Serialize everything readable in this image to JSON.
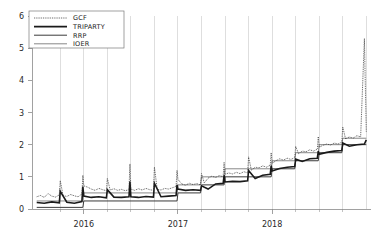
{
  "chart_data": {
    "type": "line",
    "title": "",
    "subtitle": "",
    "xlabel": "",
    "ylabel": "",
    "xlim": [
      2015.45,
      2019.05
    ],
    "ylim": [
      0,
      6
    ],
    "yticks": [
      0,
      1,
      2,
      3,
      4,
      5,
      6
    ],
    "ytick_labels": [
      "0",
      "1",
      "2",
      "3",
      "4",
      "5",
      "6"
    ],
    "xticks": [
      2016,
      2017,
      2018
    ],
    "xtick_labels": [
      "2016",
      "2017",
      "2018"
    ],
    "x_minor_ticks": [
      2015.75,
      2016.25,
      2016.5,
      2016.75,
      2017.25,
      2017.5,
      2017.75,
      2018.25,
      2018.5,
      2018.75
    ],
    "grid": "vertical-quarterly",
    "grid_x": [
      2015.75,
      2016.0,
      2016.25,
      2016.5,
      2016.75,
      2017.0,
      2017.25,
      2017.5,
      2017.75,
      2018.0,
      2018.25,
      2018.5,
      2018.75,
      2019.0
    ],
    "legend_position": "top-left",
    "legend": [
      "GCF",
      "TRIPARTY",
      "RRP",
      "IOER"
    ],
    "series": [
      {
        "name": "GCF",
        "style": "dotted",
        "color": "#303030",
        "width": 0.8,
        "x": [
          2015.5,
          2015.54,
          2015.58,
          2015.62,
          2015.66,
          2015.7,
          2015.74,
          2015.75,
          2015.78,
          2015.82,
          2015.86,
          2015.9,
          2015.94,
          2015.98,
          2015.99,
          2016.0,
          2016.04,
          2016.08,
          2016.12,
          2016.16,
          2016.2,
          2016.24,
          2016.25,
          2016.28,
          2016.32,
          2016.36,
          2016.4,
          2016.44,
          2016.48,
          2016.49,
          2016.5,
          2016.54,
          2016.58,
          2016.62,
          2016.66,
          2016.7,
          2016.74,
          2016.75,
          2016.78,
          2016.82,
          2016.86,
          2016.9,
          2016.94,
          2016.98,
          2016.99,
          2017.0,
          2017.04,
          2017.08,
          2017.12,
          2017.16,
          2017.2,
          2017.24,
          2017.25,
          2017.28,
          2017.32,
          2017.36,
          2017.4,
          2017.44,
          2017.48,
          2017.49,
          2017.5,
          2017.54,
          2017.58,
          2017.62,
          2017.66,
          2017.7,
          2017.74,
          2017.75,
          2017.78,
          2017.82,
          2017.86,
          2017.9,
          2017.94,
          2017.98,
          2017.99,
          2018.0,
          2018.04,
          2018.08,
          2018.12,
          2018.16,
          2018.2,
          2018.24,
          2018.25,
          2018.28,
          2018.32,
          2018.36,
          2018.4,
          2018.44,
          2018.48,
          2018.49,
          2018.5,
          2018.54,
          2018.58,
          2018.62,
          2018.66,
          2018.7,
          2018.74,
          2018.75,
          2018.78,
          2018.82,
          2018.86,
          2018.9,
          2018.94,
          2018.98,
          2019.0
        ],
        "y": [
          0.38,
          0.42,
          0.36,
          0.48,
          0.4,
          0.37,
          0.44,
          0.88,
          0.42,
          0.39,
          0.45,
          0.41,
          0.38,
          0.47,
          1.05,
          0.72,
          0.68,
          0.62,
          0.58,
          0.64,
          0.6,
          0.57,
          0.95,
          0.59,
          0.63,
          0.58,
          0.61,
          0.57,
          0.6,
          1.4,
          0.62,
          0.58,
          0.63,
          0.59,
          0.64,
          0.6,
          0.58,
          1.3,
          0.61,
          0.59,
          0.64,
          0.62,
          0.66,
          0.7,
          1.2,
          0.92,
          0.78,
          0.74,
          0.8,
          0.76,
          0.79,
          0.75,
          1.1,
          0.81,
          0.96,
          1.02,
          0.98,
          1.04,
          1.0,
          1.45,
          1.08,
          1.12,
          1.09,
          1.14,
          1.1,
          1.16,
          1.12,
          1.62,
          1.2,
          1.3,
          1.28,
          1.34,
          1.3,
          1.36,
          1.75,
          1.42,
          1.5,
          1.56,
          1.52,
          1.58,
          1.54,
          1.6,
          1.95,
          1.72,
          1.8,
          1.78,
          1.84,
          1.8,
          1.86,
          2.25,
          1.92,
          1.98,
          2.02,
          1.99,
          2.05,
          2.02,
          2.08,
          2.55,
          2.18,
          2.24,
          2.2,
          2.28,
          2.24,
          5.3,
          2.4
        ]
      },
      {
        "name": "TRIPARTY",
        "style": "solid-thick",
        "color": "#1a1a1a",
        "width": 1.6,
        "x": [
          2015.5,
          2015.58,
          2015.66,
          2015.74,
          2015.75,
          2015.82,
          2015.9,
          2015.98,
          2015.99,
          2016.0,
          2016.08,
          2016.16,
          2016.24,
          2016.25,
          2016.32,
          2016.4,
          2016.48,
          2016.49,
          2016.5,
          2016.58,
          2016.66,
          2016.74,
          2016.75,
          2016.82,
          2016.9,
          2016.98,
          2016.99,
          2017.0,
          2017.08,
          2017.16,
          2017.24,
          2017.25,
          2017.32,
          2017.4,
          2017.48,
          2017.49,
          2017.5,
          2017.58,
          2017.66,
          2017.74,
          2017.75,
          2017.82,
          2017.9,
          2017.98,
          2017.99,
          2018.0,
          2018.08,
          2018.16,
          2018.24,
          2018.25,
          2018.32,
          2018.4,
          2018.48,
          2018.49,
          2018.5,
          2018.58,
          2018.66,
          2018.74,
          2018.75,
          2018.82,
          2018.9,
          2018.98,
          2019.0
        ],
        "y": [
          0.2,
          0.18,
          0.22,
          0.19,
          0.55,
          0.21,
          0.18,
          0.23,
          0.7,
          0.4,
          0.36,
          0.38,
          0.35,
          0.6,
          0.37,
          0.36,
          0.38,
          0.85,
          0.38,
          0.36,
          0.39,
          0.37,
          0.8,
          0.38,
          0.4,
          0.42,
          0.75,
          0.62,
          0.58,
          0.6,
          0.58,
          0.72,
          0.62,
          0.78,
          0.8,
          1.05,
          0.84,
          0.86,
          0.85,
          0.88,
          1.2,
          0.95,
          1.05,
          1.08,
          1.35,
          1.18,
          1.26,
          1.3,
          1.32,
          1.55,
          1.48,
          1.56,
          1.58,
          1.8,
          1.7,
          1.76,
          1.8,
          1.82,
          2.05,
          1.95,
          2.0,
          2.02,
          2.15
        ]
      },
      {
        "name": "RRP",
        "style": "solid-medium",
        "color": "#3a3a3a",
        "width": 1.0,
        "x": [
          2015.5,
          2015.99,
          2016.0,
          2016.99,
          2017.0,
          2017.24,
          2017.25,
          2017.49,
          2017.5,
          2017.99,
          2018.0,
          2018.24,
          2018.25,
          2018.49,
          2018.5,
          2018.74,
          2018.75,
          2019.0
        ],
        "y": [
          0.05,
          0.05,
          0.25,
          0.25,
          0.5,
          0.5,
          0.75,
          0.75,
          1.0,
          1.0,
          1.25,
          1.25,
          1.5,
          1.5,
          1.75,
          1.75,
          2.0,
          2.0
        ]
      },
      {
        "name": "IOER",
        "style": "solid-thin",
        "color": "#555555",
        "width": 0.7,
        "x": [
          2015.5,
          2015.99,
          2016.0,
          2016.99,
          2017.0,
          2017.24,
          2017.25,
          2017.49,
          2017.5,
          2017.99,
          2018.0,
          2018.24,
          2018.25,
          2018.49,
          2018.5,
          2018.74,
          2018.75,
          2019.0
        ],
        "y": [
          0.25,
          0.25,
          0.5,
          0.5,
          0.75,
          0.75,
          1.0,
          1.0,
          1.25,
          1.25,
          1.5,
          1.5,
          1.75,
          1.75,
          2.0,
          2.0,
          2.2,
          2.2
        ]
      }
    ]
  },
  "axes": {
    "y_label_color": "#2a2a2a",
    "x_label_color": "#2a2a2a",
    "grid_color": "#c8c8c8",
    "axis_color": "#8a8a8a"
  }
}
